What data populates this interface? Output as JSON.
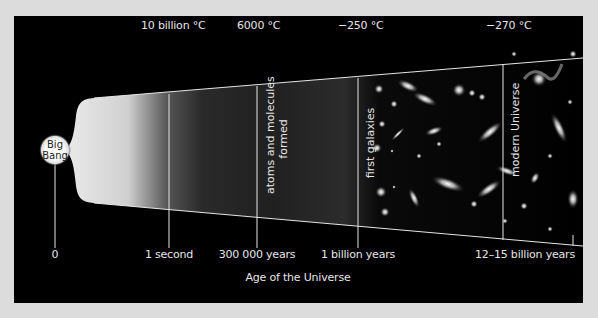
{
  "temperatures": [
    {
      "label": "10 billion °C"
    },
    {
      "label": "6000 °C"
    },
    {
      "label": "−250 °C"
    },
    {
      "label": "−270 °C"
    }
  ],
  "ages": [
    {
      "label": "0"
    },
    {
      "label": "1 second"
    },
    {
      "label": "300 000 years"
    },
    {
      "label": "1 billion years"
    },
    {
      "label": "12–15 billion years"
    }
  ],
  "axis_title": "Age of the Universe",
  "big_bang": {
    "line1": "Big",
    "line2": "Bang"
  },
  "era_labels": {
    "atoms_line1": "atoms and molecules",
    "atoms_line2": "formed",
    "first_galaxies": "first galaxies",
    "modern_universe": "modern Universe"
  },
  "colors": {
    "panel": "#000000",
    "background": "#dcdcdc",
    "line": "#e6e6e6"
  }
}
